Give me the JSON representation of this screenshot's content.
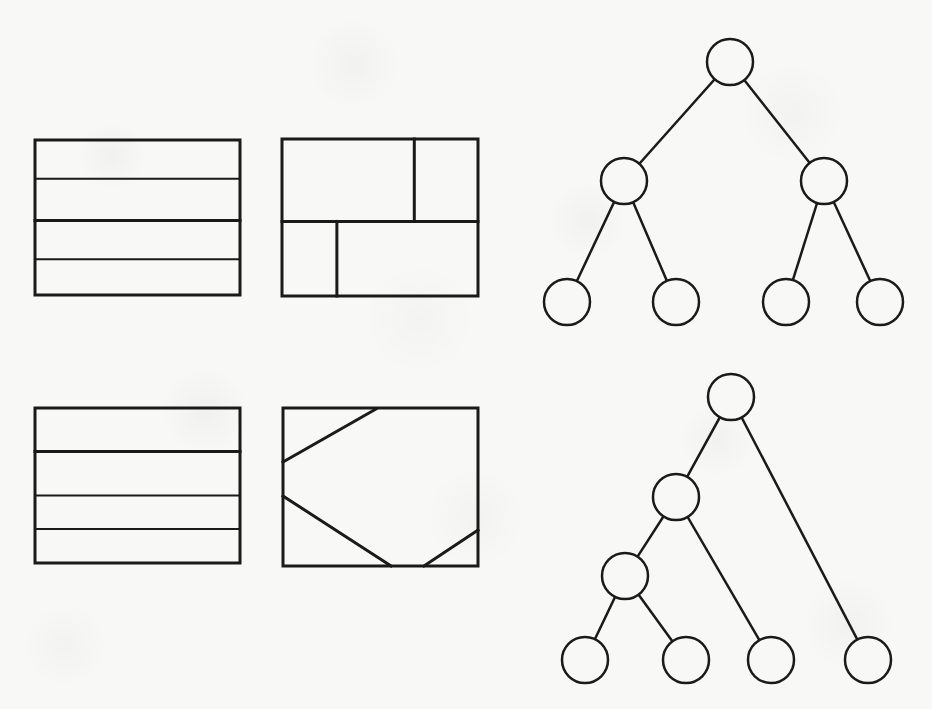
{
  "page": {
    "background_color": "#f8f8f7",
    "ink_color": "#1a1a1a",
    "width": 932,
    "height": 709,
    "running_head_text": "",
    "page_number": ""
  },
  "figure": {
    "caption": "",
    "panels": [
      {
        "id": "panel-top-left",
        "name": "rectangle-partition-horizontal-slabs-a",
        "kind": "rectangle-partition",
        "frame": {
          "x": 35,
          "y": 140,
          "width": 205,
          "height": 155
        },
        "frame_stroke_width": 3,
        "cuts": [
          {
            "type": "horizontal",
            "at": 0.25,
            "stroke_width": 2
          },
          {
            "type": "horizontal",
            "at": 0.52,
            "stroke_width": 3
          },
          {
            "type": "horizontal",
            "at": 0.77,
            "stroke_width": 2
          }
        ],
        "region_count": 4
      },
      {
        "id": "panel-top-right",
        "name": "rectangle-partition-pinwheel",
        "kind": "rectangle-partition",
        "frame": {
          "x": 282,
          "y": 139,
          "width": 196,
          "height": 157
        },
        "frame_stroke_width": 3,
        "cuts": [
          {
            "type": "horizontal",
            "at": 0.525,
            "stroke_width": 3
          },
          {
            "type": "vertical",
            "at": 0.675,
            "from": 0.0,
            "to": 0.525,
            "stroke_width": 3
          },
          {
            "type": "vertical",
            "at": 0.28,
            "from": 0.525,
            "to": 1.0,
            "stroke_width": 3
          }
        ],
        "region_count": 4
      },
      {
        "id": "panel-bottom-left",
        "name": "rectangle-partition-horizontal-slabs-b",
        "kind": "rectangle-partition",
        "frame": {
          "x": 35,
          "y": 408,
          "width": 205,
          "height": 155
        },
        "frame_stroke_width": 3,
        "cuts": [
          {
            "type": "horizontal",
            "at": 0.28,
            "stroke_width": 3
          },
          {
            "type": "horizontal",
            "at": 0.565,
            "stroke_width": 2
          },
          {
            "type": "horizontal",
            "at": 0.78,
            "stroke_width": 2
          }
        ],
        "region_count": 4
      },
      {
        "id": "panel-bottom-right",
        "name": "rectangle-partition-diagonal-cuts",
        "kind": "rectangle-partition",
        "frame": {
          "x": 283,
          "y": 408,
          "width": 195,
          "height": 158
        },
        "frame_stroke_width": 3,
        "cuts": [
          {
            "type": "diagonal",
            "x1": 283,
            "y1": 462,
            "x2": 376,
            "y2": 409,
            "stroke_width": 3
          },
          {
            "type": "diagonal",
            "x1": 283,
            "y1": 496,
            "x2": 391,
            "y2": 566,
            "stroke_width": 3
          },
          {
            "type": "diagonal",
            "x1": 424,
            "y1": 566,
            "x2": 478,
            "y2": 530,
            "stroke_width": 3
          }
        ],
        "region_count": 4
      },
      {
        "id": "panel-tree-top",
        "name": "binary-tree-balanced",
        "kind": "tree",
        "node_radius": 23,
        "edge_stroke_width": 2.5,
        "node_stroke_width": 2.5,
        "node_fill": "none",
        "nodes": [
          {
            "id": "t-root",
            "label": "",
            "cx": 730,
            "cy": 62,
            "depth": 0
          },
          {
            "id": "t-l",
            "label": "",
            "cx": 624,
            "cy": 181,
            "depth": 1
          },
          {
            "id": "t-r",
            "label": "",
            "cx": 824,
            "cy": 181,
            "depth": 1
          },
          {
            "id": "t-ll",
            "label": "",
            "cx": 567,
            "cy": 302,
            "depth": 2
          },
          {
            "id": "t-lr",
            "label": "",
            "cx": 676,
            "cy": 302,
            "depth": 2
          },
          {
            "id": "t-rl",
            "label": "",
            "cx": 786,
            "cy": 302,
            "depth": 2
          },
          {
            "id": "t-rr",
            "label": "",
            "cx": 880,
            "cy": 302,
            "depth": 2
          }
        ],
        "edges": [
          {
            "from": "t-root",
            "to": "t-l"
          },
          {
            "from": "t-root",
            "to": "t-r"
          },
          {
            "from": "t-l",
            "to": "t-ll"
          },
          {
            "from": "t-l",
            "to": "t-lr"
          },
          {
            "from": "t-r",
            "to": "t-rl"
          },
          {
            "from": "t-r",
            "to": "t-rr"
          }
        ],
        "node_count": 7,
        "leaf_count": 4,
        "height": 2
      },
      {
        "id": "panel-tree-bottom",
        "name": "binary-tree-left-skewed",
        "kind": "tree",
        "node_radius": 23,
        "edge_stroke_width": 2.5,
        "node_stroke_width": 2.5,
        "node_fill": "none",
        "nodes": [
          {
            "id": "b-root",
            "label": "",
            "cx": 731,
            "cy": 397,
            "depth": 0
          },
          {
            "id": "b-a",
            "label": "",
            "cx": 676,
            "cy": 497,
            "depth": 1
          },
          {
            "id": "b-b",
            "label": "",
            "cx": 625,
            "cy": 576,
            "depth": 2
          },
          {
            "id": "b-l1",
            "label": "",
            "cx": 585,
            "cy": 660,
            "depth": 3
          },
          {
            "id": "b-l2",
            "label": "",
            "cx": 686,
            "cy": 660,
            "depth": 3
          },
          {
            "id": "b-l3",
            "label": "",
            "cx": 771,
            "cy": 660,
            "depth": 2
          },
          {
            "id": "b-l4",
            "label": "",
            "cx": 868,
            "cy": 660,
            "depth": 1
          }
        ],
        "edges": [
          {
            "from": "b-root",
            "to": "b-a"
          },
          {
            "from": "b-root",
            "to": "b-l4"
          },
          {
            "from": "b-a",
            "to": "b-b"
          },
          {
            "from": "b-a",
            "to": "b-l3"
          },
          {
            "from": "b-b",
            "to": "b-l1"
          },
          {
            "from": "b-b",
            "to": "b-l2"
          }
        ],
        "node_count": 7,
        "leaf_count": 4,
        "height": 3
      }
    ]
  }
}
